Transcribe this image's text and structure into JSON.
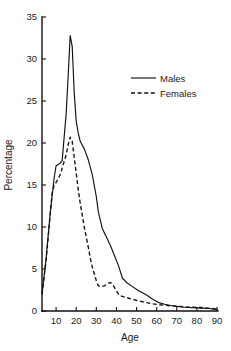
{
  "chart_data": {
    "type": "line",
    "title": "",
    "xlabel": "Age",
    "ylabel": "Percentage",
    "xlim": [
      0,
      90
    ],
    "ylim": [
      0,
      35
    ],
    "xticks": [
      10,
      20,
      30,
      40,
      50,
      60,
      70,
      80,
      90
    ],
    "yticks": [
      0,
      5,
      10,
      15,
      20,
      25,
      30,
      35
    ],
    "xtick_labels": [
      "10",
      "20",
      "30",
      "40",
      "50",
      "60",
      "70",
      "80",
      "90"
    ],
    "ytick_labels": [
      "0",
      "5",
      "10",
      "15",
      "20",
      "25",
      "30",
      "35"
    ],
    "grid": false,
    "legend_position": "upper right",
    "series": [
      {
        "name": "Males",
        "style": "solid",
        "color": "#111111",
        "x": [
          3,
          5,
          7,
          9,
          10,
          12,
          13,
          15,
          16,
          17,
          18,
          19,
          20,
          21,
          22,
          24,
          26,
          28,
          30,
          31,
          33,
          35,
          37,
          39,
          41,
          43,
          45,
          48,
          51,
          55,
          58,
          61,
          64,
          67,
          70,
          74,
          78,
          82,
          86,
          90
        ],
        "y": [
          2.0,
          6.2,
          11.5,
          15.8,
          17.3,
          17.6,
          17.9,
          23.5,
          28.0,
          32.8,
          31.5,
          26.0,
          22.6,
          21.2,
          20.2,
          19.3,
          18.0,
          16.2,
          13.6,
          11.8,
          9.8,
          8.8,
          7.8,
          6.6,
          5.4,
          3.9,
          3.4,
          2.9,
          2.4,
          1.9,
          1.4,
          1.0,
          0.8,
          0.65,
          0.55,
          0.45,
          0.4,
          0.35,
          0.3,
          0.2
        ]
      },
      {
        "name": "Females",
        "style": "dashed",
        "color": "#111111",
        "x": [
          3,
          5,
          7,
          8,
          9,
          10,
          12,
          13,
          15,
          16,
          17,
          18,
          19,
          20,
          21,
          22,
          24,
          26,
          27,
          28,
          30,
          31,
          32,
          34,
          36,
          37,
          38,
          40,
          41,
          42,
          45,
          48,
          51,
          55,
          58,
          61,
          64,
          67,
          70,
          74,
          78,
          82,
          86,
          90
        ],
        "y": [
          2.0,
          6.0,
          11.3,
          14.0,
          15.0,
          15.3,
          16.2,
          17.0,
          18.6,
          19.8,
          20.7,
          20.2,
          18.3,
          16.4,
          14.5,
          12.8,
          10.0,
          7.6,
          6.3,
          5.2,
          3.6,
          3.0,
          2.9,
          3.0,
          3.3,
          3.4,
          3.2,
          2.4,
          2.0,
          1.8,
          1.6,
          1.4,
          1.2,
          1.0,
          0.85,
          0.75,
          0.68,
          0.62,
          0.58,
          0.5,
          0.45,
          0.42,
          0.35,
          0.2
        ]
      }
    ],
    "legend_entries": [
      {
        "label": "Males",
        "style": "solid"
      },
      {
        "label": "Females",
        "style": "dashed"
      }
    ]
  }
}
